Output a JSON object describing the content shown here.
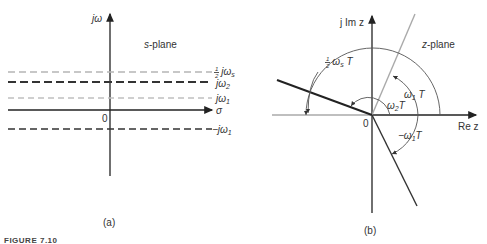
{
  "figure": {
    "caption": "FIGURE 7.10",
    "panels": [
      {
        "id": "a",
        "label": "(a)",
        "plane_label_italic": "s",
        "plane_label_rest": "-plane",
        "y_axis_label": "jω",
        "x_axis_label": "σ",
        "origin_label": "0",
        "lines": [
          {
            "label_frac": "1/2",
            "label_num": "1",
            "label_den": "2",
            "label_main": "jω",
            "label_sub": "s",
            "style": "dashed-light",
            "color": "#b5b5b5"
          },
          {
            "label_main": "jω",
            "label_sub": "2",
            "style": "dashed-dark",
            "color": "#333333"
          },
          {
            "label_main": "jω",
            "label_sub": "1",
            "style": "dashed-light",
            "color": "#c0c0c0"
          },
          {
            "label_main": "−jω",
            "label_sub": "1",
            "style": "dashed-dark",
            "color": "#333333"
          }
        ]
      },
      {
        "id": "b",
        "label": "(b)",
        "plane_label_italic": "z",
        "plane_label_rest": "-plane",
        "y_axis_label": "j Im z",
        "x_axis_label": "Re z",
        "origin_label": "0",
        "angles": [
          {
            "label_num": "1",
            "label_den": "2",
            "label_main": "ω",
            "label_sub": "s",
            "label_tail": "T"
          },
          {
            "label_main": "ω",
            "label_sub": "1",
            "label_tail": "T"
          },
          {
            "label_main": "ω",
            "label_sub": "2",
            "label_tail": "T"
          },
          {
            "label_main": "−ω",
            "label_sub": "1",
            "label_tail": "T"
          }
        ]
      }
    ]
  }
}
